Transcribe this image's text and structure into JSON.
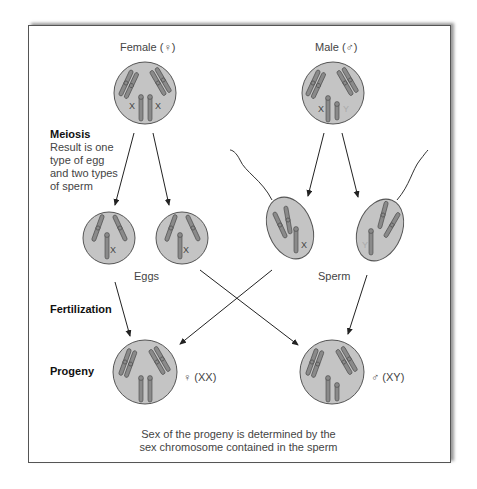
{
  "labels": {
    "female": "Female (♀)",
    "male": "Male (♂)",
    "meiosis_title": "Meiosis",
    "meiosis_desc": [
      "Result is one",
      "type of egg",
      "and two types",
      "of sperm"
    ],
    "eggs": "Eggs",
    "sperm": "Sperm",
    "fertilization": "Fertilization",
    "progeny": "Progeny",
    "progeny_female": "♀ (XX)",
    "progeny_male": "♂ (XY)"
  },
  "chromosome_labels": {
    "female_parent": [
      "X",
      "X"
    ],
    "male_parent": [
      "X",
      "Y"
    ],
    "egg1": "X",
    "egg2": "X",
    "sperm1": "X",
    "sperm2": "Y"
  },
  "caption": [
    "Sex of the progeny is determined by the",
    "sex chromosome contained in the sperm"
  ],
  "colors": {
    "cell_fill": "#c4c4c4",
    "chromosome": "#8a8a8a",
    "y_label": "#aaaaaa"
  }
}
